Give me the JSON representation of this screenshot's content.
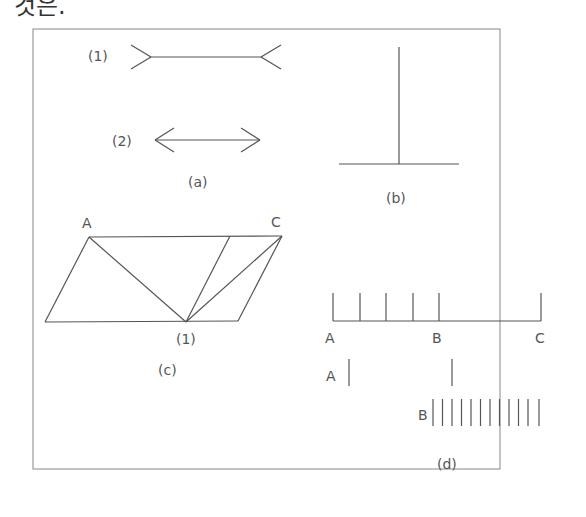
{
  "header": {
    "text": "것은."
  },
  "figure": {
    "panels": {
      "a": {
        "caption": "(a)",
        "item1_label": "(1)",
        "item2_label": "(2)"
      },
      "b": {
        "caption": "(b)"
      },
      "c": {
        "caption": "(c)",
        "point_a": "A",
        "point_c": "C",
        "point_1": "(1)"
      },
      "d": {
        "caption": "(d)",
        "label_a_top": "A",
        "label_b_top": "B",
        "label_c_top": "C",
        "label_a_row": "A",
        "label_b_row": "B",
        "b_row_tick_count": 12
      }
    },
    "colors": {
      "stroke": "#555555",
      "border": "#888888"
    }
  }
}
